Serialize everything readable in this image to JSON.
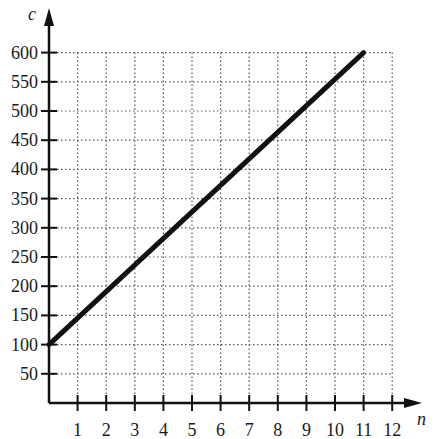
{
  "chart_data": {
    "type": "line",
    "title": "",
    "xlabel": "n",
    "ylabel": "c",
    "xlim": [
      0,
      12
    ],
    "ylim": [
      0,
      600
    ],
    "x_ticks": [
      1,
      2,
      3,
      4,
      5,
      6,
      7,
      8,
      9,
      10,
      11,
      12
    ],
    "y_ticks": [
      50,
      100,
      150,
      200,
      250,
      300,
      350,
      400,
      450,
      500,
      550,
      600
    ],
    "grid": true,
    "grid_style": "dotted",
    "legend": null,
    "series": [
      {
        "name": "c",
        "x": [
          0,
          11
        ],
        "y": [
          100,
          600
        ],
        "color": "#111111"
      }
    ]
  },
  "labels": {
    "x_axis": "n",
    "y_axis": "c"
  }
}
